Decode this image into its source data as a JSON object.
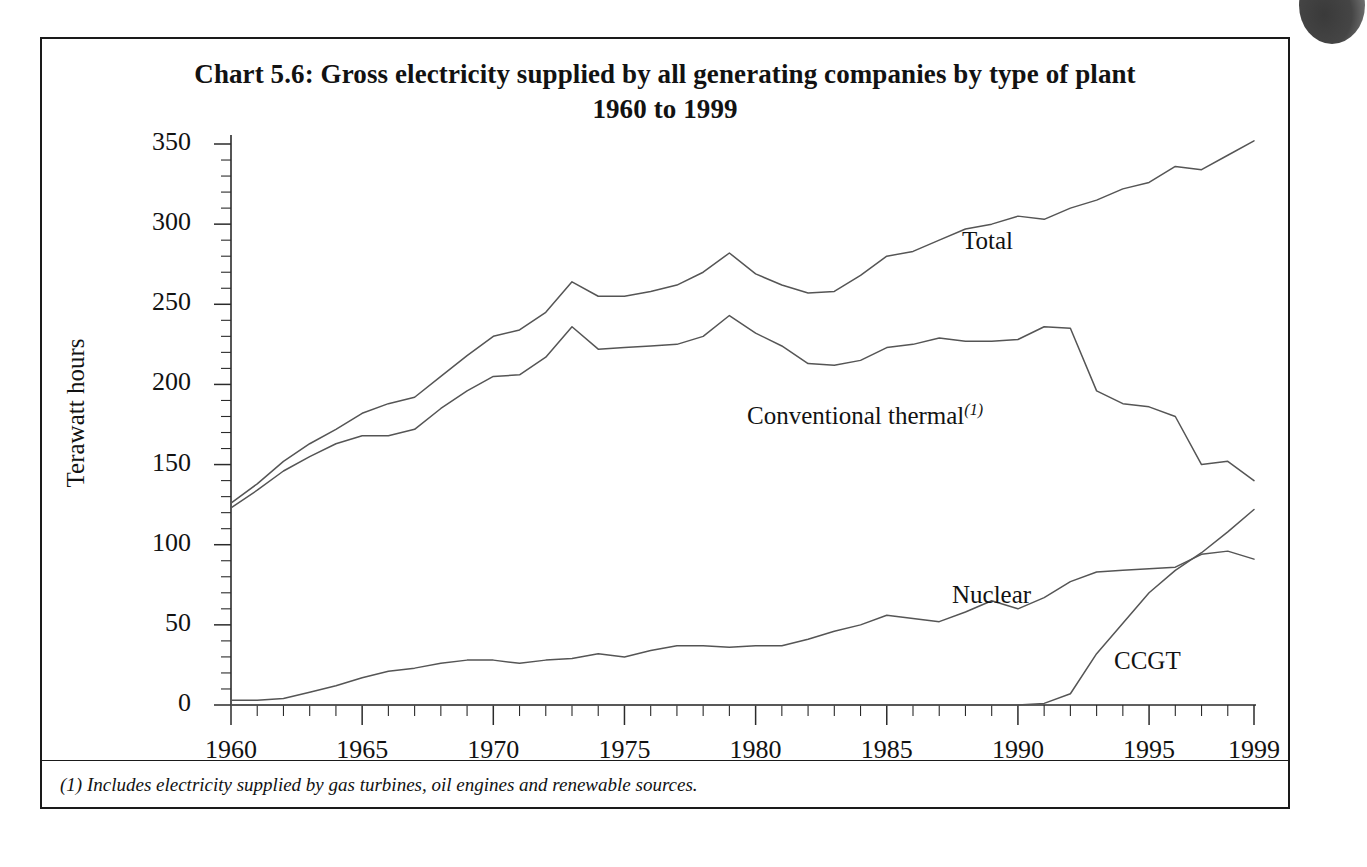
{
  "figure": {
    "title_line1": "Chart 5.6:  Gross electricity supplied by all generating companies by type of plant",
    "title_line2": "1960 to 1999",
    "footnote": "(1) Includes electricity supplied by gas turbines, oil engines and renewable sources.",
    "y_axis_title": "Terawatt hours",
    "series_labels": {
      "total": "Total",
      "conventional_thermal": "Conventional thermal",
      "conventional_thermal_sup": "(1)",
      "nuclear": "Nuclear",
      "ccgt": "CCGT"
    }
  },
  "chart_data": {
    "type": "line",
    "title": "Chart 5.6:  Gross electricity supplied by all generating companies by type of plant 1960 to 1999",
    "subtitle": "1960 to 1999",
    "xlabel": "",
    "ylabel": "Terawatt hours",
    "xlim": [
      1960,
      1999
    ],
    "ylim": [
      0,
      350
    ],
    "yticks": [
      0,
      50,
      100,
      150,
      200,
      250,
      300,
      350
    ],
    "ytick_labels": [
      "0",
      "50",
      "100",
      "150",
      "200",
      "250",
      "300",
      "350"
    ],
    "y_minor_tick_step": 10,
    "xticks": [
      1960,
      1965,
      1970,
      1975,
      1980,
      1985,
      1990,
      1995,
      1999
    ],
    "xtick_labels": [
      "1960",
      "1965",
      "1970",
      "1975",
      "1980",
      "1985",
      "1990",
      "1995",
      "1999"
    ],
    "x_minor_tick_step": 1,
    "grid": false,
    "legend_position": "inline-annotations",
    "line_color": "#555555",
    "x": [
      1960,
      1961,
      1962,
      1963,
      1964,
      1965,
      1966,
      1967,
      1968,
      1969,
      1970,
      1971,
      1972,
      1973,
      1974,
      1975,
      1976,
      1977,
      1978,
      1979,
      1980,
      1981,
      1982,
      1983,
      1984,
      1985,
      1986,
      1987,
      1988,
      1989,
      1990,
      1991,
      1992,
      1993,
      1994,
      1995,
      1996,
      1997,
      1998,
      1999
    ],
    "series": [
      {
        "name": "Total",
        "values": [
          126,
          138,
          152,
          163,
          172,
          182,
          188,
          192,
          205,
          218,
          230,
          234,
          245,
          264,
          255,
          255,
          258,
          262,
          270,
          282,
          269,
          262,
          257,
          258,
          268,
          280,
          283,
          290,
          297,
          300,
          305,
          303,
          310,
          315,
          322,
          326,
          336,
          334,
          343,
          352
        ]
      },
      {
        "name": "Conventional thermal",
        "values": [
          123,
          134,
          146,
          155,
          163,
          168,
          168,
          172,
          185,
          196,
          205,
          206,
          217,
          236,
          222,
          223,
          224,
          225,
          230,
          243,
          232,
          224,
          213,
          212,
          215,
          223,
          225,
          229,
          227,
          227,
          228,
          236,
          235,
          196,
          188,
          186,
          180,
          150,
          152,
          140
        ]
      },
      {
        "name": "Nuclear",
        "values": [
          3,
          3,
          4,
          8,
          12,
          17,
          21,
          23,
          26,
          28,
          28,
          26,
          28,
          29,
          32,
          30,
          34,
          37,
          37,
          36,
          37,
          37,
          41,
          46,
          50,
          56,
          54,
          52,
          58,
          65,
          60,
          67,
          77,
          83,
          84,
          85,
          86,
          94,
          96,
          91
        ]
      },
      {
        "name": "CCGT",
        "values": [
          0,
          0,
          0,
          0,
          0,
          0,
          0,
          0,
          0,
          0,
          0,
          0,
          0,
          0,
          0,
          0,
          0,
          0,
          0,
          0,
          0,
          0,
          0,
          0,
          0,
          0,
          0,
          0,
          0,
          0,
          0,
          1,
          7,
          32,
          51,
          70,
          84,
          95,
          108,
          122
        ]
      }
    ]
  }
}
